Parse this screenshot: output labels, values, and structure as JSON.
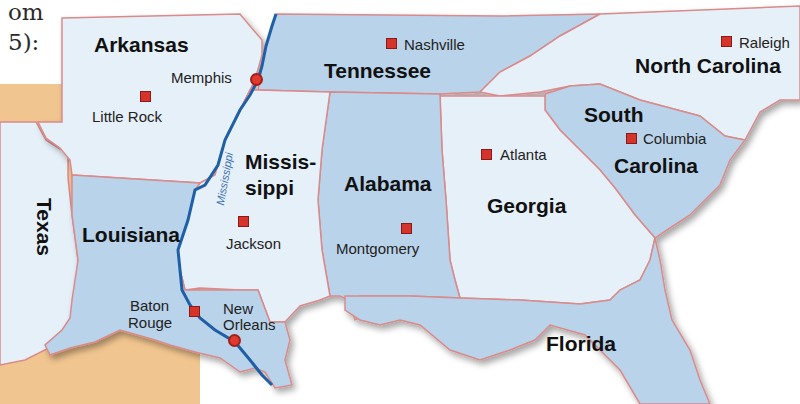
{
  "fragment_text": {
    "line1": "om",
    "line2": "5):"
  },
  "colors": {
    "state_dark": "#b9d3ea",
    "state_light": "#e6f0f9",
    "border": "#d98a8a",
    "river": "#1f5fa6",
    "land_outside": "#f1c58f",
    "capital": "#d6332b"
  },
  "states": [
    {
      "name": "Arkansas",
      "label": "Arkansas"
    },
    {
      "name": "Tennessee",
      "label": "Tennessee"
    },
    {
      "name": "North Carolina",
      "label": "North Carolina"
    },
    {
      "name": "South Carolina",
      "label_line1": "South",
      "label_line2": "Carolina"
    },
    {
      "name": "Mississippi",
      "label_line1": "Missis-",
      "label_line2": "sippi"
    },
    {
      "name": "Alabama",
      "label": "Alabama"
    },
    {
      "name": "Georgia",
      "label": "Georgia"
    },
    {
      "name": "Louisiana",
      "label": "Louisiana"
    },
    {
      "name": "Texas",
      "label": "Texas"
    },
    {
      "name": "Florida",
      "label": "Florida"
    }
  ],
  "capitals": [
    {
      "name": "Little Rock"
    },
    {
      "name": "Nashville"
    },
    {
      "name": "Raleigh"
    },
    {
      "name": "Columbia"
    },
    {
      "name": "Jackson"
    },
    {
      "name": "Montgomery"
    },
    {
      "name": "Atlanta"
    },
    {
      "name": "Baton Rouge",
      "line1": "Baton",
      "line2": "Rouge"
    }
  ],
  "cities": [
    {
      "name": "Memphis"
    },
    {
      "name": "New Orleans",
      "line1": "New",
      "line2": "Orleans"
    }
  ],
  "rivers": [
    {
      "name": "Mississippi"
    }
  ]
}
